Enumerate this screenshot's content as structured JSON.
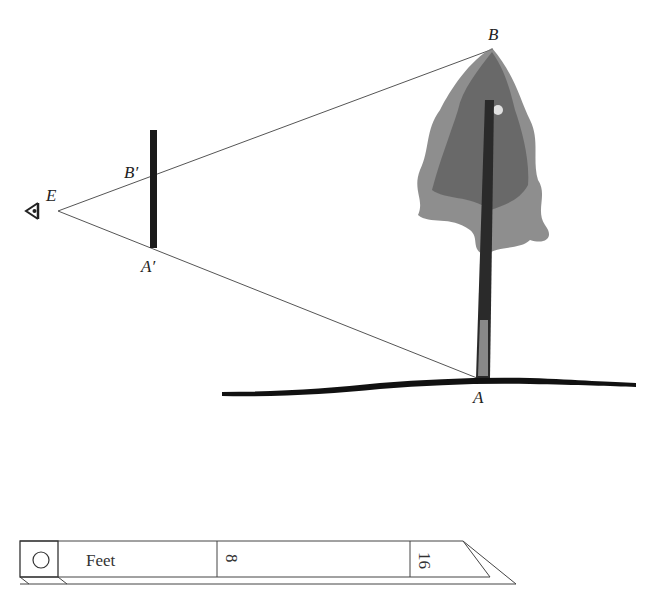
{
  "diagram": {
    "points": {
      "E": {
        "label": "E"
      },
      "B": {
        "label": "B"
      },
      "A": {
        "label": "A"
      },
      "B_prime": {
        "label": "B′"
      },
      "A_prime": {
        "label": "A′"
      }
    },
    "icons": [
      "eye-icon",
      "tree-icon"
    ],
    "colors": {
      "line": "#555555",
      "stick": "#1a1a1a",
      "ground": "#111111",
      "tree": "#6b6b6b"
    }
  },
  "ruler": {
    "unit_label": "Feet",
    "marks": [
      "8",
      "16"
    ]
  }
}
